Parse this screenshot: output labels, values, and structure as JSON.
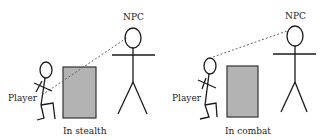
{
  "diagram": {
    "colors": {
      "line": "#1a1a1a",
      "cover_fill": "#b3b3b3",
      "cover_stroke": "#333333",
      "sight_line": "#666666"
    },
    "scenes": [
      {
        "id": "stealth",
        "caption": "In stealth",
        "npc_label": "NPC",
        "player_label": "Player",
        "sight_line": "dashed line from NPC passes through cover to player"
      },
      {
        "id": "combat",
        "caption": "In combat",
        "npc_label": "NPC",
        "player_label": "Player",
        "sight_line": "dashed line from NPC goes over cover to player's head"
      }
    ]
  }
}
